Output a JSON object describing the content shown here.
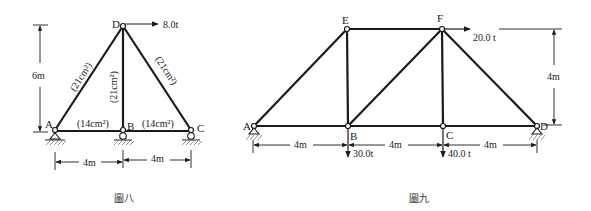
{
  "figures": [
    {
      "caption": "圖八",
      "nodes": {
        "A": "A",
        "B": "B",
        "C": "C",
        "D": "D"
      },
      "members": [
        {
          "name": "AD",
          "area": "(21cm²)"
        },
        {
          "name": "BD",
          "area": "(21cm²)"
        },
        {
          "name": "CD",
          "area": "(21cm²)"
        },
        {
          "name": "AB",
          "area": "(14cm²)"
        },
        {
          "name": "BC",
          "area": "(14cm²)"
        }
      ],
      "loads": [
        {
          "node": "D",
          "direction": "right",
          "label": "8.0t"
        }
      ],
      "dimensions": {
        "height": "6m",
        "spans": [
          "4m",
          "4m"
        ]
      }
    },
    {
      "caption": "圖九",
      "nodes": {
        "A": "A",
        "B": "B",
        "C": "C",
        "D": "D",
        "E": "E",
        "F": "F"
      },
      "loads": [
        {
          "node": "F",
          "direction": "right",
          "label": "20.0 t"
        },
        {
          "node": "B",
          "direction": "down",
          "label": "30.0t"
        },
        {
          "node": "C",
          "direction": "down",
          "label": "40.0 t"
        }
      ],
      "dimensions": {
        "height": "4m",
        "spans": [
          "4m",
          "4m",
          "4m"
        ]
      }
    }
  ]
}
